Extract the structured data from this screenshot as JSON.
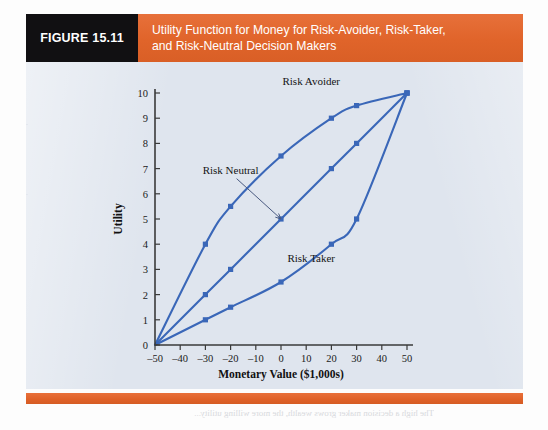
{
  "figure": {
    "tag": "FIGURE 15.11",
    "title_line1": "Utility Function for Money for Risk-Avoider, Risk-Taker,",
    "title_line2": "and Risk-Neutral Decision Makers",
    "tag_bg": "#111012",
    "title_bg": "#e2672c",
    "panel_bg": "#dfe5ee",
    "accent": "#3a67b8"
  },
  "ghost_text": "The high a decision maker grows wealth, the more willing utility...",
  "chart_data": {
    "type": "line",
    "title": "Utility Function for Money for Risk-Avoider, Risk-Taker, and Risk-Neutral Decision Makers",
    "xlabel": "Monetary Value ($1,000s)",
    "ylabel": "Utility",
    "xlim": [
      -50,
      50
    ],
    "ylim": [
      0,
      10
    ],
    "xticks": [
      -50,
      -40,
      -30,
      -20,
      -10,
      0,
      10,
      20,
      30,
      40,
      50
    ],
    "xticklabels": [
      "–50",
      "–40",
      "–30",
      "–20",
      "–10",
      "0",
      "10",
      "20",
      "30",
      "40",
      "50"
    ],
    "yticks": [
      0,
      1,
      2,
      3,
      4,
      5,
      6,
      7,
      8,
      9,
      10
    ],
    "yticklabels": [
      "0",
      "1",
      "2",
      "3",
      "4",
      "5",
      "6",
      "7",
      "8",
      "9",
      "10"
    ],
    "grid": false,
    "legend": "inline-annotations",
    "series": [
      {
        "name": "Risk Avoider",
        "color": "#3a67b8",
        "x": [
          -50,
          -30,
          -20,
          0,
          20,
          30,
          50
        ],
        "y": [
          0,
          4,
          5.5,
          7.5,
          9,
          9.5,
          10
        ],
        "label_x": 12,
        "label_y": 10.3
      },
      {
        "name": "Risk Neutral",
        "color": "#3a67b8",
        "x": [
          -50,
          -30,
          -20,
          0,
          20,
          30,
          50
        ],
        "y": [
          0,
          2,
          3,
          5,
          7,
          8,
          10
        ],
        "label_x": -27,
        "label_y": 7.1
      },
      {
        "name": "Risk Taker",
        "color": "#3a67b8",
        "x": [
          -50,
          -30,
          -20,
          0,
          20,
          30,
          50
        ],
        "y": [
          0,
          1,
          1.5,
          2.5,
          4,
          5,
          10
        ],
        "label_x": 12,
        "label_y": 3.3
      }
    ],
    "annotations": [
      {
        "text": "Risk Neutral",
        "from_x": -20,
        "from_y": 6.8,
        "to_x": 0,
        "to_y": 5.0
      }
    ]
  }
}
